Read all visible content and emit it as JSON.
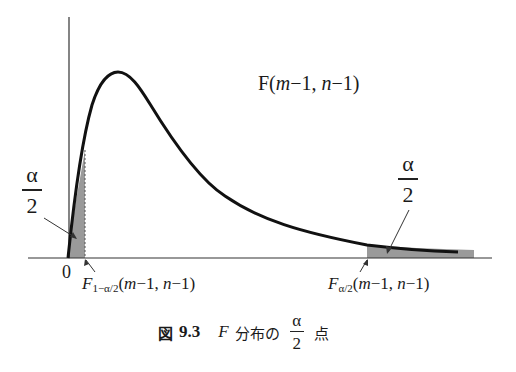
{
  "diagram": {
    "distribution_label": {
      "prefix": "F(",
      "m": "m",
      "mid1": "−1, ",
      "n": "n",
      "suffix": "−1)"
    },
    "origin_label": "0",
    "left_tail": {
      "numerator": "α",
      "denominator": "2"
    },
    "right_tail": {
      "numerator": "α",
      "denominator": "2"
    },
    "left_critical": {
      "var": "F",
      "sub": "1−α/2",
      "args_m": "m",
      "args_rest1": "−1, ",
      "args_n": "n",
      "args_rest2": "−1)",
      "open": "("
    },
    "right_critical": {
      "var": "F",
      "sub": "α/2",
      "args_m": "m",
      "args_rest1": "−1, ",
      "args_n": "n",
      "args_rest2": "−1)",
      "open": "("
    },
    "colors": {
      "curve": "#111111",
      "axis": "#333333",
      "shade": "#9a9a9a",
      "text": "#1a1a1a"
    }
  },
  "caption": {
    "figure_word": "図",
    "number": "9.3",
    "var": "F",
    "text": "分布の",
    "frac_num": "α",
    "frac_den": "2",
    "suffix": "点"
  }
}
